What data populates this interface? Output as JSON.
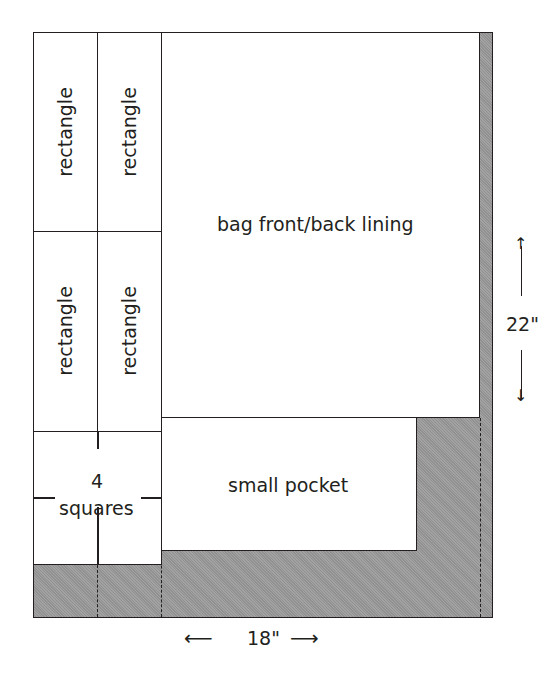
{
  "diagram": {
    "pieces": {
      "rectangle_1": "rectangle",
      "rectangle_2": "rectangle",
      "rectangle_3": "rectangle",
      "rectangle_4": "rectangle",
      "squares_count": "4",
      "squares_label": "squares",
      "lining": "bag front/back lining",
      "pocket": "small pocket"
    },
    "dimensions": {
      "height": "22\"",
      "width": "18\""
    },
    "arrows": {
      "up": "↑",
      "down": "↓",
      "left": "⟵",
      "right": "⟶"
    },
    "colors": {
      "fabric_shade": "#9a9a9a",
      "line": "#231f20",
      "piece": "#ffffff"
    }
  }
}
